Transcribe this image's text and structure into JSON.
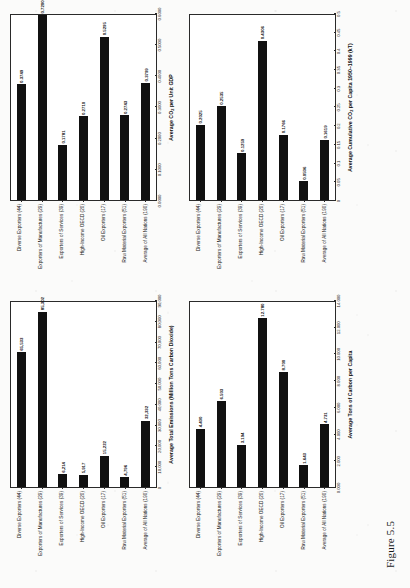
{
  "figure": {
    "caption": "Figure 5.5"
  },
  "categories": [
    "Diverse Exporters (44)",
    "Exporters of Manufactures (29)",
    "Exporters of Services (39)",
    "High-Income OECD (20)",
    "Oil Exporters (17)",
    "Raw Material Exporters (51)",
    "Average of All Nations (190)"
  ],
  "chart_data": [
    {
      "id": "total-emissions",
      "type": "bar",
      "orientation": "horizontal",
      "title": "",
      "xlabel": "Average Total Emissions (Million Tons Carbon Dioxide)",
      "ylabel": "",
      "categories": [
        "Diverse Exporters (44)",
        "Exporters of Manufactures (29)",
        "Exporters of Services (39)",
        "High-Income OECD (20)",
        "Oil Exporters (17)",
        "Raw Material Exporters (51)",
        "Average of All Nations (190)"
      ],
      "values": [
        65533,
        85302,
        6214,
        5917,
        15222,
        4796,
        32332
      ],
      "value_labels": [
        "65,533",
        "85,302",
        "6,214",
        "5,917",
        "15,222",
        "4,796",
        "32,332"
      ],
      "xlim": [
        0,
        90000
      ],
      "xticks": [
        0,
        10000,
        20000,
        30000,
        40000,
        50000,
        60000,
        70000,
        80000,
        90000
      ],
      "xtick_labels": [
        "0",
        "10,000",
        "20,000",
        "30,000",
        "40,000",
        "50,000",
        "60,000",
        "70,000",
        "80,000",
        "90,000"
      ],
      "grid": false,
      "legend": "none"
    },
    {
      "id": "co2-per-unit-gdp",
      "type": "bar",
      "orientation": "horizontal",
      "title": "",
      "xlabel": "Average CO2 per Unit GDP",
      "xlabel_html": "Average CO<sub>2</sub> per Unit GDP",
      "ylabel": "",
      "categories": [
        "Diverse Exporters (44)",
        "Exporters of Manufactures (29)",
        "Exporters of Services (39)",
        "High-Income OECD (20)",
        "Oil Exporters (17)",
        "Raw Material Exporters (51)",
        "Average of All Nations (190)"
      ],
      "values": [
        0.3749,
        0.72,
        0.1781,
        0.271,
        0.5295,
        0.2743,
        0.3799
      ],
      "value_labels": [
        "0.3749",
        "0.7200",
        "0.1781",
        "0.2710",
        "0.5295",
        "0.2743",
        "0.3799"
      ],
      "xlim": [
        0,
        0.6
      ],
      "xticks": [
        0,
        0.1,
        0.2,
        0.3,
        0.4,
        0.5,
        0.6
      ],
      "xtick_labels": [
        "0.0000",
        "0.1000",
        "0.2000",
        "0.3000",
        "0.4000",
        "0.5000",
        "0.6000"
      ],
      "grid": false,
      "legend": "none"
    },
    {
      "id": "tons-carbon-per-capita",
      "type": "bar",
      "orientation": "horizontal",
      "title": "",
      "xlabel": "Average Tons of Carbon per Capita",
      "ylabel": "",
      "categories": [
        "Diverse Exporters (44)",
        "Exporters of Manufactures (29)",
        "Exporters of Services (39)",
        "High-Income OECD (20)",
        "Oil Exporters (17)",
        "Raw Material Exporters (51)",
        "Average of All Nations (190)"
      ],
      "values": [
        4.4,
        6.503,
        3.194,
        12.78,
        8.7,
        1.643,
        4.731
      ],
      "value_labels": [
        "4.400",
        "6.503",
        "3.194",
        "12.780",
        "8.700",
        "1.643",
        "4.731"
      ],
      "xlim": [
        0,
        14
      ],
      "xticks": [
        0,
        2,
        4,
        6,
        8,
        10,
        12,
        14
      ],
      "xtick_labels": [
        "0.000",
        "2.000",
        "4.000",
        "6.000",
        "8.000",
        "10.000",
        "12.000",
        "14.000"
      ],
      "grid": false,
      "legend": "none"
    },
    {
      "id": "cumulative-co2-per-capita",
      "type": "bar",
      "orientation": "horizontal",
      "title": "",
      "xlabel": "Average Cumulative CO2 per Capita 1950-1999 (kT)",
      "xlabel_html": "Average Cumulative CO<sub>2</sub> per Capita 1950–1999 (kT)",
      "ylabel": "",
      "categories": [
        "Diverse Exporters (44)",
        "Exporters of Manufactures (29)",
        "Exporters of Services (39)",
        "High-Income OECD (20)",
        "Oil Exporters (17)",
        "Raw Material Exporters (51)",
        "Average of All Nations (190)"
      ],
      "values": [
        0.2025,
        0.2535,
        0.1259,
        0.4306,
        0.1766,
        0.0506,
        0.1619
      ],
      "value_labels": [
        "0.2025",
        "0.2535",
        "0.1259",
        "0.4306",
        "0.1766",
        "0.0506",
        "0.1619"
      ],
      "xlim": [
        0,
        0.5
      ],
      "xticks": [
        0,
        0.05,
        0.1,
        0.15,
        0.2,
        0.25,
        0.3,
        0.35,
        0.4,
        0.45,
        0.5
      ],
      "xtick_labels": [
        "0",
        "0.05",
        "0.1",
        "0.15",
        "0.2",
        "0.25",
        "0.3",
        "0.35",
        "0.4",
        "0.45",
        "0.5"
      ],
      "grid": false,
      "legend": "none"
    }
  ]
}
